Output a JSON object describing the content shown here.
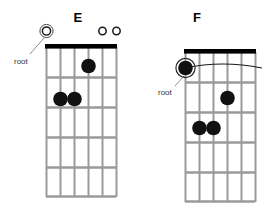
{
  "page": {
    "kind": "guitar-chord-diagrams",
    "background": "#ffffff",
    "ink": "#000000",
    "string_color": "#9a9a9a",
    "fret_color": "#9a9a9a",
    "nut_color": "#000000",
    "dot_color": "#111111",
    "label_color": "#333333"
  },
  "diagrams": [
    {
      "id": "chord-e",
      "title": "E",
      "root_label": "root",
      "strings": 6,
      "frets": 5,
      "nut": true,
      "barre": null,
      "open_markers": [
        {
          "string": 6,
          "glyph": "0",
          "ringed": true,
          "is_root": true
        },
        {
          "string": 2,
          "glyph": "o",
          "ringed": false,
          "is_root": false
        },
        {
          "string": 1,
          "glyph": "o",
          "ringed": false,
          "is_root": false
        }
      ],
      "dots": [
        {
          "string": 3,
          "fret": 1
        },
        {
          "string": 5,
          "fret": 2
        },
        {
          "string": 4,
          "fret": 2
        }
      ]
    },
    {
      "id": "chord-f",
      "title": "F",
      "root_label": "root",
      "strings": 6,
      "frets": 5,
      "nut": true,
      "barre": {
        "fret": 1,
        "from_string": 6,
        "to_string": 1
      },
      "open_markers": [],
      "root_dot": {
        "string": 6,
        "fret": 1,
        "ringed": true
      },
      "dots": [
        {
          "string": 3,
          "fret": 2
        },
        {
          "string": 5,
          "fret": 3
        },
        {
          "string": 4,
          "fret": 3
        }
      ]
    }
  ]
}
